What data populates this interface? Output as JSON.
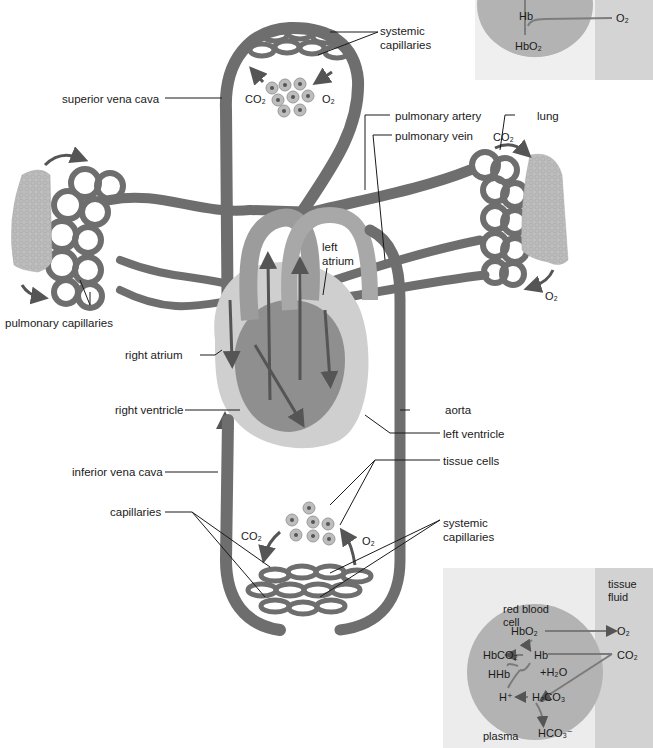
{
  "labels": {
    "systemic_capillaries_top": [
      "systemic",
      "capillaries"
    ],
    "superior_vena_cava": "superior vena cava",
    "pulmonary_artery": "pulmonary artery",
    "pulmonary_vein": "pulmonary vein",
    "lung": "lung",
    "left_atrium": [
      "left",
      "atrium"
    ],
    "pulmonary_capillaries": "pulmonary capillaries",
    "right_atrium": "right atrium",
    "right_ventricle": "right ventricle",
    "aorta": "aorta",
    "left_ventricle": "left ventricle",
    "inferior_vena_cava": "inferior vena cava",
    "tissue_cells": "tissue cells",
    "capillaries": "capillaries",
    "systemic_capillaries_bottom": [
      "systemic",
      "capillaries"
    ]
  },
  "gas_labels": {
    "co2_top": "CO₂",
    "o2_top": "O₂",
    "co2_lung": "CO₂",
    "o2_lung": "O₂",
    "co2_bottom": "CO₂",
    "o2_bottom": "O₂"
  },
  "inset_top": {
    "hb": "Hb",
    "hbo2": "HbO₂",
    "o2": "O₂"
  },
  "inset_bottom": {
    "tissue_fluid": [
      "tissue",
      "fluid"
    ],
    "red_blood_cell": [
      "red blood",
      "cell"
    ],
    "hbo2": "HbO₂",
    "o2": "O₂",
    "hbco2": "HbCO₂",
    "hb": "Hb",
    "co2": "CO₂",
    "hhb": "HHb",
    "plus_h2o": "+H₂O",
    "h_plus": "H⁺",
    "h2co3": "H₂CO₃",
    "plasma": "plasma",
    "hco3": "HCO₃⁻"
  },
  "colors": {
    "vessel": "#6e6e6e",
    "vessel_dark": "#4a4a4a",
    "heart_light": "#c8c8c8",
    "lung": "#b9b9b9",
    "cell_circle": "#b0b0b0",
    "inset_bg": "#e9e9e9",
    "tissue_fluid_bg": "#d2d2d2",
    "arrow": "#555555",
    "leader_line": "#1a1a1a"
  }
}
